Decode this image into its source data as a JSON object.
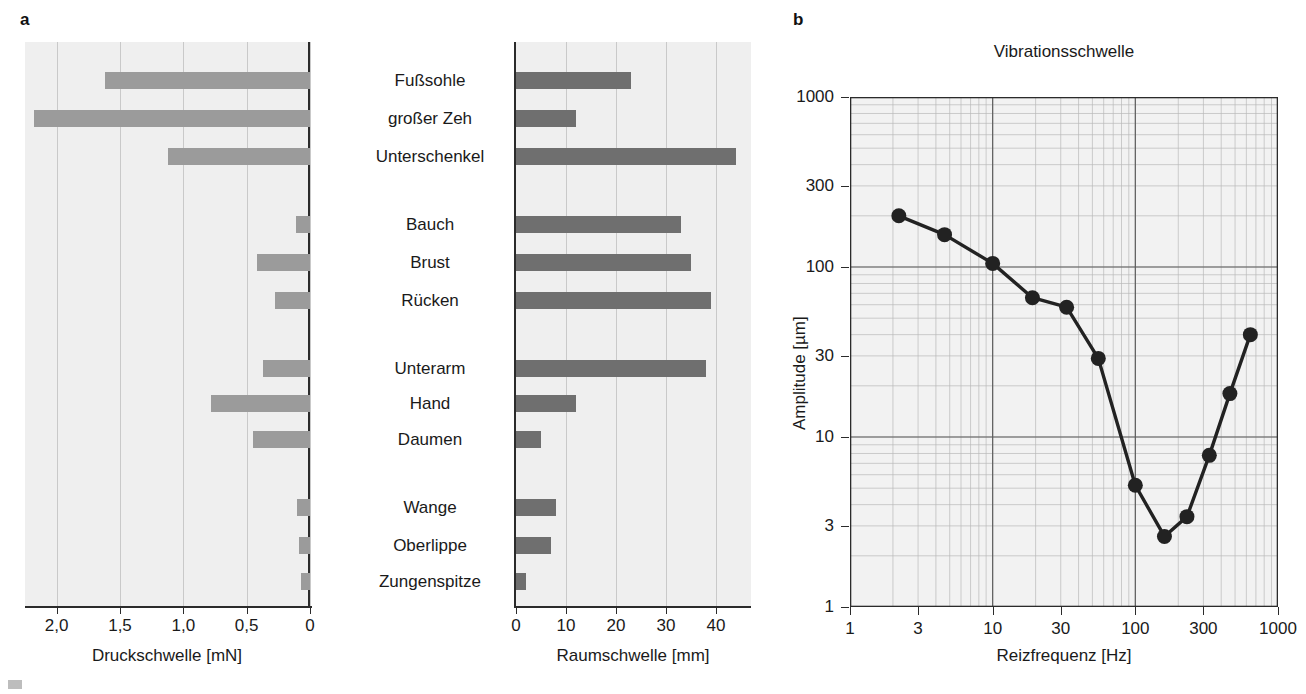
{
  "panels": {
    "a": {
      "letter": "a"
    },
    "b": {
      "letter": "b"
    }
  },
  "categories": [
    "Fußsohle",
    "großer Zeh",
    "Unterschenkel",
    "Bauch",
    "Brust",
    "Rücken",
    "Unterarm",
    "Hand",
    "Daumen",
    "Wange",
    "Oberlippe",
    "Zungenspitze"
  ],
  "chart_data": [
    {
      "type": "bar",
      "orientation": "horizontal-reversed",
      "title": "",
      "xlabel": "Druckschwelle [mN]",
      "ylabel": "",
      "categories": [
        "Fußsohle",
        "großer Zeh",
        "Unterschenkel",
        "Bauch",
        "Brust",
        "Rücken",
        "Unterarm",
        "Hand",
        "Daumen",
        "Wange",
        "Oberlippe",
        "Zungenspitze"
      ],
      "values": [
        1.62,
        2.18,
        1.12,
        0.11,
        0.42,
        0.28,
        0.37,
        0.78,
        0.45,
        0.1,
        0.09,
        0.07
      ],
      "xlim": [
        2.25,
        0
      ],
      "xticks": [
        2.0,
        1.5,
        1.0,
        0.5,
        0
      ],
      "xticklabels": [
        "2,0",
        "1,5",
        "1,0",
        "0,5",
        "0"
      ],
      "bar_color": "#9b9b9b",
      "grid": true,
      "legend": "none"
    },
    {
      "type": "bar",
      "orientation": "horizontal",
      "title": "",
      "xlabel": "Raumschwelle [mm]",
      "ylabel": "",
      "categories": [
        "Fußsohle",
        "großer Zeh",
        "Unterschenkel",
        "Bauch",
        "Brust",
        "Rücken",
        "Unterarm",
        "Hand",
        "Daumen",
        "Wange",
        "Oberlippe",
        "Zungenspitze"
      ],
      "values": [
        23,
        12,
        44,
        33,
        35,
        39,
        38,
        12,
        5,
        8,
        7,
        2
      ],
      "xlim": [
        0,
        47
      ],
      "xticks": [
        0,
        10,
        20,
        30,
        40
      ],
      "xticklabels": [
        "0",
        "10",
        "20",
        "30",
        "40"
      ],
      "bar_color": "#6f6f6f",
      "grid": true,
      "legend": "none"
    },
    {
      "type": "line",
      "title": "Vibrationsschwelle",
      "xlabel": "Reizfrequenz [Hz]",
      "ylabel": "Amplitude [µm]",
      "xscale": "log",
      "yscale": "log",
      "xlim": [
        1,
        1000
      ],
      "ylim": [
        1,
        1000
      ],
      "xticks": [
        1,
        3,
        10,
        30,
        100,
        300,
        1000
      ],
      "xticklabels": [
        "1",
        "3",
        "10",
        "30",
        "100",
        "300",
        "1000"
      ],
      "yticks": [
        1,
        3,
        10,
        30,
        100,
        300,
        1000
      ],
      "yticklabels": [
        "1",
        "3",
        "10",
        "30",
        "100",
        "300",
        "1000"
      ],
      "x": [
        2.2,
        4.6,
        10,
        19,
        33,
        55,
        100,
        160,
        230,
        330,
        460,
        640
      ],
      "y": [
        200,
        155,
        105,
        66,
        58,
        29,
        5.2,
        2.6,
        3.4,
        7.8,
        18,
        40
      ],
      "marker": "circle",
      "marker_color": "#222222",
      "line_color": "#222222",
      "grid": true,
      "legend": "none"
    }
  ]
}
